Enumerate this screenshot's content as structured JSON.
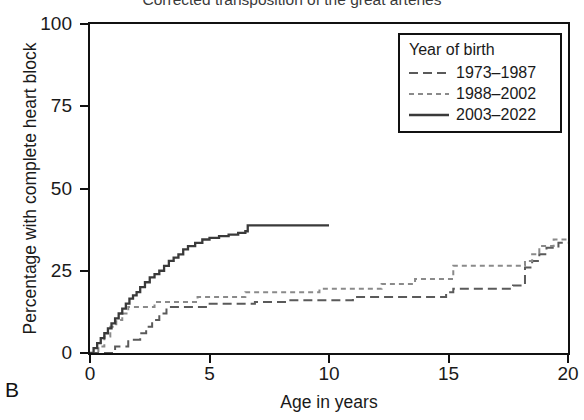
{
  "chart_data": {
    "type": "line",
    "title": "Corrected transposition of the great arteries",
    "panel_label": "B",
    "xlabel": "Age in years",
    "ylabel": "Percentage with complete heart block",
    "xlim": [
      0,
      20
    ],
    "ylim": [
      0,
      100
    ],
    "xticks": [
      0,
      5,
      10,
      15,
      20
    ],
    "yticks": [
      0,
      25,
      50,
      75,
      100
    ],
    "grid": false,
    "legend_title": "Year of birth",
    "legend_position": "top-right",
    "series": [
      {
        "name": "1973-1987",
        "style": "long-dash",
        "color": "#5a5a5a",
        "final_value": 33.5,
        "x": [
          0.0,
          0.9,
          1.05,
          1.3,
          1.6,
          1.9,
          2.1,
          2.35,
          2.6,
          2.9,
          3.2,
          4.6,
          4.9,
          6.6,
          6.9,
          8.0,
          8.3,
          10.7,
          11.0,
          14.6,
          14.9,
          15.2,
          17.4,
          17.7,
          18.2,
          18.5,
          18.8,
          19.1,
          19.6,
          20.0
        ],
        "y": [
          0.0,
          0.0,
          2.0,
          2.0,
          4.0,
          4.0,
          6.0,
          8.0,
          10.0,
          12.0,
          14.0,
          14.0,
          15.0,
          15.0,
          15.5,
          15.5,
          16.0,
          16.0,
          17.0,
          17.0,
          18.5,
          19.5,
          19.5,
          20.5,
          26.0,
          28.0,
          30.0,
          32.0,
          33.5,
          33.5
        ]
      },
      {
        "name": "1988-2002",
        "style": "short-dash",
        "color": "#8a8a8a",
        "final_value": 34.5,
        "x": [
          0.0,
          0.35,
          0.6,
          0.85,
          1.1,
          1.35,
          1.6,
          2.4,
          2.7,
          4.2,
          4.5,
          6.2,
          6.5,
          9.3,
          9.6,
          11.9,
          12.2,
          13.3,
          13.6,
          14.9,
          15.2,
          17.9,
          18.2,
          18.5,
          18.8,
          19.4,
          20.0
        ],
        "y": [
          0.0,
          2.0,
          5.0,
          8.0,
          10.0,
          12.0,
          14.0,
          14.0,
          15.5,
          15.5,
          17.0,
          17.0,
          18.5,
          18.5,
          19.5,
          19.5,
          21.0,
          21.0,
          22.5,
          22.5,
          26.5,
          26.5,
          28.0,
          30.0,
          32.5,
          34.5,
          34.5
        ]
      },
      {
        "name": "2003-2022",
        "style": "solid",
        "color": "#3a3a3a",
        "final_value": 38.8,
        "x": [
          0.0,
          0.15,
          0.3,
          0.45,
          0.6,
          0.75,
          0.9,
          1.05,
          1.2,
          1.35,
          1.5,
          1.65,
          1.8,
          1.95,
          2.1,
          2.3,
          2.5,
          2.7,
          2.9,
          3.1,
          3.3,
          3.5,
          3.7,
          3.9,
          4.1,
          4.4,
          4.7,
          5.0,
          5.4,
          5.8,
          6.2,
          6.5,
          6.6,
          7.0,
          10.0
        ],
        "y": [
          0.0,
          1.5,
          3.0,
          4.5,
          6.0,
          7.5,
          9.0,
          10.5,
          12.0,
          13.5,
          15.0,
          16.5,
          17.5,
          18.5,
          20.0,
          21.5,
          23.0,
          24.0,
          25.0,
          26.5,
          28.0,
          29.0,
          30.0,
          31.5,
          32.5,
          33.5,
          34.5,
          35.0,
          35.5,
          36.0,
          36.5,
          37.0,
          38.8,
          38.8,
          38.8
        ]
      }
    ]
  }
}
